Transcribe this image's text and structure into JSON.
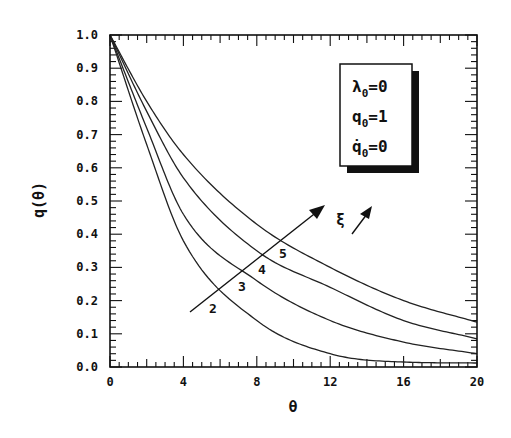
{
  "chart_data": {
    "type": "line",
    "title": "",
    "xlabel": "θ",
    "ylabel": "q(θ)",
    "xlim": [
      0,
      20
    ],
    "ylim": [
      0.0,
      1.0
    ],
    "x_ticks": [
      0,
      4,
      8,
      12,
      16,
      20
    ],
    "x_tick_labels": [
      "0",
      "4",
      "8",
      "12",
      "16",
      "20"
    ],
    "y_ticks": [
      0.0,
      0.1,
      0.2,
      0.3,
      0.4,
      0.5,
      0.6,
      0.7,
      0.8,
      0.9,
      1.0
    ],
    "y_tick_labels": [
      "0.0",
      "0.1",
      "0.2",
      "0.3",
      "0.4",
      "0.5",
      "0.6",
      "0.7",
      "0.8",
      "0.9",
      "1.0"
    ],
    "grid": false,
    "legend_position": "upper right (boxed parameters)",
    "x": [
      0,
      2,
      4,
      8,
      12,
      16,
      20
    ],
    "series": [
      {
        "name": "2",
        "values": [
          1.0,
          0.67,
          0.38,
          0.14,
          0.04,
          0.015,
          0.012
        ]
      },
      {
        "name": "3",
        "values": [
          1.0,
          0.72,
          0.46,
          0.26,
          0.14,
          0.075,
          0.04
        ]
      },
      {
        "name": "4",
        "values": [
          1.0,
          0.77,
          0.57,
          0.35,
          0.24,
          0.14,
          0.085
        ]
      },
      {
        "name": "5",
        "values": [
          1.0,
          0.8,
          0.64,
          0.43,
          0.3,
          0.2,
          0.135
        ]
      }
    ],
    "annotations": [
      {
        "text": "ξ ↗",
        "meaning": "curves ordered by increasing ξ, arrow crossing curves 2→5"
      }
    ],
    "parameters_box": [
      {
        "symbol": "λ",
        "sub": "0",
        "value": "0"
      },
      {
        "symbol": "q",
        "sub": "0",
        "value": "1"
      },
      {
        "symbol": "q̇",
        "sub": "0",
        "value": "0"
      }
    ]
  },
  "labels": {
    "xlabel": "θ",
    "ylabel": "q(θ)",
    "xi": "ξ",
    "curve_labels": [
      "2",
      "3",
      "4",
      "5"
    ],
    "legend": {
      "line1_sym": "λ",
      "line1_sub": "0",
      "line1_val": "=0",
      "line2_sym": "q",
      "line2_sub": "0",
      "line2_val": "=1",
      "line3_sym": "q̇",
      "line3_sub": "0",
      "line3_val": "=0"
    }
  }
}
